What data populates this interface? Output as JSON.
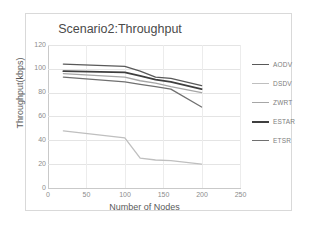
{
  "chart_data": {
    "type": "line",
    "title": "Scenario2:Throughput",
    "xlabel": "Number of Nodes",
    "ylabel": "Throughput(kbps)",
    "xlim": [
      0,
      250
    ],
    "ylim": [
      0,
      120
    ],
    "xticks": [
      0,
      50,
      100,
      150,
      200,
      250
    ],
    "yticks": [
      0,
      20,
      40,
      60,
      80,
      100,
      120
    ],
    "grid": true,
    "legend_position": "right",
    "x": [
      20,
      100,
      120,
      140,
      160,
      200
    ],
    "series": [
      {
        "name": "AODV",
        "color": "#595959",
        "width": 1.3,
        "values": [
          104,
          102,
          98,
          93,
          92,
          86
        ]
      },
      {
        "name": "DSDV",
        "color": "#bfbfbf",
        "width": 1.3,
        "values": [
          48,
          42,
          25,
          23.5,
          23,
          20
        ]
      },
      {
        "name": "ZWRT",
        "color": "#a6a6a6",
        "width": 1.3,
        "values": [
          96,
          93,
          90,
          88,
          85,
          80
        ]
      },
      {
        "name": "ESTAR",
        "color": "#3f3f3f",
        "width": 1.8,
        "values": [
          98,
          97,
          94,
          91,
          89,
          83
        ]
      },
      {
        "name": "ETSR",
        "color": "#707070",
        "width": 1.3,
        "values": [
          93,
          89,
          87,
          85,
          83,
          68
        ]
      }
    ]
  },
  "legend": {
    "items": [
      {
        "label": "AODV"
      },
      {
        "label": "DSDV"
      },
      {
        "label": "ZWRT"
      },
      {
        "label": "ESTAR"
      },
      {
        "label": "ETSR"
      }
    ]
  },
  "axes": {
    "y_tick_labels": [
      "120",
      "100",
      "80",
      "60",
      "40",
      "20",
      "0"
    ],
    "x_tick_labels": [
      "0",
      "50",
      "100",
      "150",
      "200",
      "250"
    ]
  },
  "colors": {
    "grid": "#e4e4e4",
    "axis": "#c9c9c9",
    "title_text": "#4a4a4a",
    "tick_text": "#8c8c8c",
    "frame": "#d9d9d9"
  }
}
